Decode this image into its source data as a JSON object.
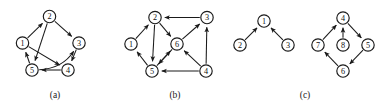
{
  "figure": {
    "background_color": "#ffffff",
    "ink_color": "#1a1a1a",
    "panels": [
      {
        "id": "panel-a",
        "caption": "(a)",
        "caption_x": 55,
        "caption_y": 98,
        "node_radius": 6.2,
        "nodes": [
          {
            "id": "a1",
            "label": "1",
            "cx": 22.5,
            "cy": 43.0
          },
          {
            "id": "a2",
            "label": "2",
            "cx": 49.5,
            "cy": 16.5
          },
          {
            "id": "a3",
            "label": "3",
            "cx": 79.0,
            "cy": 43.0
          },
          {
            "id": "a4",
            "label": "4",
            "cx": 68.0,
            "cy": 70.0
          },
          {
            "id": "a5",
            "label": "5",
            "cx": 32.0,
            "cy": 70.0
          }
        ],
        "edges": [
          {
            "from": "a1",
            "to": "a2",
            "kind": "straight"
          },
          {
            "from": "a2",
            "to": "a3",
            "kind": "straight"
          },
          {
            "from": "a2",
            "to": "a5",
            "kind": "straight"
          },
          {
            "from": "a3",
            "to": "a4",
            "kind": "straight"
          },
          {
            "from": "a4",
            "to": "a5",
            "kind": "straight"
          },
          {
            "from": "a5",
            "to": "a1",
            "kind": "straight"
          },
          {
            "from": "a1",
            "to": "a4",
            "kind": "straight"
          },
          {
            "from": "a5",
            "to": "a3",
            "kind": "curved",
            "bow": 14
          }
        ]
      },
      {
        "id": "panel-b",
        "caption": "(b)",
        "caption_x": 175,
        "caption_y": 98,
        "node_radius": 6.2,
        "nodes": [
          {
            "id": "b1",
            "label": "1",
            "cx": 131.0,
            "cy": 44.0
          },
          {
            "id": "b2",
            "label": "2",
            "cx": 155.0,
            "cy": 17.5
          },
          {
            "id": "b3",
            "label": "3",
            "cx": 207.0,
            "cy": 17.5
          },
          {
            "id": "b6",
            "label": "6",
            "cx": 177.0,
            "cy": 44.0
          },
          {
            "id": "b5",
            "label": "5",
            "cx": 152.0,
            "cy": 71.0
          },
          {
            "id": "b4",
            "label": "4",
            "cx": 206.0,
            "cy": 71.0
          }
        ],
        "edges": [
          {
            "from": "b1",
            "to": "b2",
            "kind": "straight"
          },
          {
            "from": "b3",
            "to": "b2",
            "kind": "straight"
          },
          {
            "from": "b2",
            "to": "b5",
            "kind": "straight"
          },
          {
            "from": "b2",
            "to": "b6",
            "kind": "straight"
          },
          {
            "from": "b6",
            "to": "b3",
            "kind": "straight"
          },
          {
            "from": "b6",
            "to": "b5",
            "kind": "straight"
          },
          {
            "from": "b5",
            "to": "b1",
            "kind": "straight"
          },
          {
            "from": "b5",
            "to": "b6",
            "kind": "straight"
          },
          {
            "from": "b4",
            "to": "b5",
            "kind": "straight"
          },
          {
            "from": "b4",
            "to": "b6",
            "kind": "straight"
          },
          {
            "from": "b4",
            "to": "b3",
            "kind": "straight"
          }
        ]
      },
      {
        "id": "panel-c",
        "caption": "(c)",
        "caption_x": 305,
        "caption_y": 98,
        "node_radius": 6.2,
        "nodes": [
          {
            "id": "c1",
            "label": "1",
            "cx": 264.0,
            "cy": 21.0
          },
          {
            "id": "c2",
            "label": "2",
            "cx": 240.0,
            "cy": 45.0
          },
          {
            "id": "c3",
            "label": "3",
            "cx": 288.0,
            "cy": 45.0
          },
          {
            "id": "c4",
            "label": "4",
            "cx": 343.0,
            "cy": 18.0
          },
          {
            "id": "c7",
            "label": "7",
            "cx": 318.0,
            "cy": 45.0
          },
          {
            "id": "c8",
            "label": "8",
            "cx": 343.0,
            "cy": 45.0
          },
          {
            "id": "c5",
            "label": "5",
            "cx": 368.0,
            "cy": 45.0
          },
          {
            "id": "c6",
            "label": "6",
            "cx": 343.0,
            "cy": 71.0
          }
        ],
        "edges": [
          {
            "from": "c2",
            "to": "c1",
            "kind": "straight"
          },
          {
            "from": "c3",
            "to": "c1",
            "kind": "straight"
          },
          {
            "from": "c7",
            "to": "c4",
            "kind": "straight"
          },
          {
            "from": "c8",
            "to": "c4",
            "kind": "straight"
          },
          {
            "from": "c4",
            "to": "c5",
            "kind": "straight"
          },
          {
            "from": "c5",
            "to": "c6",
            "kind": "straight"
          },
          {
            "from": "c6",
            "to": "c7",
            "kind": "straight"
          }
        ]
      }
    ]
  }
}
